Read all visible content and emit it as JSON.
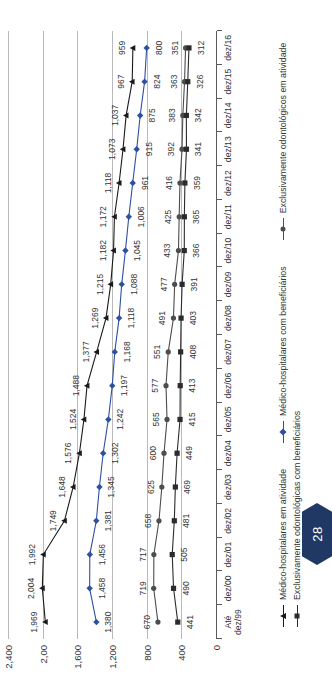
{
  "chart_data": {
    "type": "line",
    "title": "",
    "xlabel": "",
    "ylabel": "",
    "ylim": [
      0,
      2400
    ],
    "yticks": [
      0,
      400,
      800,
      1200,
      1600,
      2000,
      2400
    ],
    "ytick_labels": [
      "0",
      "400",
      "800",
      "1,200",
      "1,600",
      "2,00",
      "2,400"
    ],
    "grid": true,
    "legend_position": "bottom",
    "categories": [
      "Até\ndez/99",
      "dez/00",
      "dez/01",
      "dez/02",
      "dez/03",
      "dez/04",
      "dez/05",
      "dez/06",
      "dez/07",
      "dez/08",
      "dez/09",
      "dez/10",
      "dez/11",
      "dez/12",
      "dez/13",
      "dez/14",
      "dez/15",
      "dez/16"
    ],
    "series": [
      {
        "name": "Médico-hospitalares em atividade",
        "color": "#1a1a1a",
        "marker": "triangle",
        "values": [
          1969,
          2004,
          1992,
          1749,
          1648,
          1576,
          1524,
          1488,
          1377,
          1269,
          1215,
          1182,
          1172,
          1118,
          1073,
          1037,
          967,
          959
        ],
        "labels": [
          "1,969",
          "2,004",
          "1,992",
          "1,749",
          "1,648",
          "1,576",
          "1,524",
          "1,488",
          "1,377",
          "1,269",
          "1,215",
          "1,182",
          "1,172",
          "1,118",
          "1,073",
          "1,037",
          "967",
          "959"
        ]
      },
      {
        "name": "Médico-hospitalares com beneficiários",
        "color": "#2d50a0",
        "marker": "diamond",
        "values": [
          1380,
          1458,
          1456,
          1381,
          1345,
          1302,
          1242,
          1197,
          1168,
          1118,
          1088,
          1045,
          1006,
          961,
          915,
          875,
          824,
          800
        ],
        "labels": [
          "1,380",
          "1,458",
          "1,456",
          "1,381",
          "1,345",
          "1,302",
          "1,242",
          "1,197",
          "1,168",
          "1,118",
          "1,088",
          "1,045",
          "1,006",
          "961",
          "915",
          "875",
          "824",
          "800"
        ]
      },
      {
        "name": "Exclusivamente odontológicos em atividade",
        "color": "#4d4d4d",
        "marker": "circle",
        "values": [
          670,
          719,
          717,
          658,
          625,
          600,
          565,
          577,
          551,
          491,
          477,
          433,
          425,
          416,
          392,
          383,
          363,
          351
        ],
        "labels": [
          "670",
          "719",
          "717",
          "658",
          "625",
          "600",
          "565",
          "577",
          "551",
          "491",
          "477",
          "433",
          "425",
          "416",
          "392",
          "383",
          "363",
          "351"
        ]
      },
      {
        "name": "Exclusivamente odontológicas com beneficiários",
        "color": "#2b2b2b",
        "marker": "square",
        "values": [
          441,
          490,
          505,
          481,
          469,
          449,
          415,
          413,
          408,
          403,
          391,
          366,
          365,
          359,
          341,
          342,
          326,
          312
        ],
        "labels": [
          "441",
          "490",
          "505",
          "481",
          "469",
          "449",
          "415",
          "413",
          "408",
          "403",
          "391",
          "366",
          "365",
          "359",
          "341",
          "342",
          "326",
          "312"
        ]
      }
    ]
  },
  "page": {
    "number": "28"
  }
}
